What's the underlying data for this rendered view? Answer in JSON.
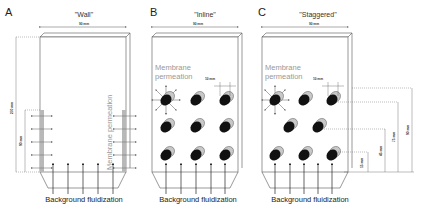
{
  "panels": [
    {
      "letter": "A",
      "title": "\"Wall\"",
      "width_label": "90 mm",
      "height_label": "270 mm",
      "membrane_height_label": "90 mm",
      "permeation_label": "Membrane permeation",
      "fluidization_label": "Background fluidization"
    },
    {
      "letter": "B",
      "title": "\"Inline\"",
      "width_label": "90 mm",
      "tube_spacing_label": "10 mm",
      "permeation_label_1": "Membrane",
      "permeation_label_2": "permeation",
      "fluidization_label": "Background fluidization"
    },
    {
      "letter": "C",
      "title": "\"Staggered\"",
      "width_label": "90 mm",
      "tube_spacing_label": "10 mm",
      "permeation_label_1": "Membrane",
      "permeation_label_2": "permeation",
      "fluidization_label": "Background fluidization",
      "heights": [
        "15 mm",
        "45 mm",
        "75 mm",
        "90 mm"
      ]
    }
  ],
  "colors": {
    "line": "#555555",
    "membrane": "#b8b8b8",
    "tube_dark": "#111111",
    "tube_light": "#c8c8c8",
    "text_gray": "#999999"
  }
}
